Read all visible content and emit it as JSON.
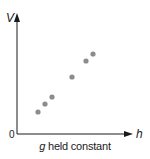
{
  "chart_data": {
    "type": "scatter",
    "title": "",
    "xlabel": "h",
    "ylabel": "V",
    "origin_label": "0",
    "caption_var": "g",
    "caption_rest": " held constant",
    "grid": false,
    "legend": null,
    "colors": {
      "axis": "#1a1a1a",
      "point": "#8c8c8c"
    },
    "points_px": [
      {
        "x": 38,
        "y": 112
      },
      {
        "x": 45,
        "y": 104
      },
      {
        "x": 52,
        "y": 97
      },
      {
        "x": 72,
        "y": 77
      },
      {
        "x": 86,
        "y": 61
      },
      {
        "x": 93,
        "y": 54
      }
    ],
    "note": "Qualitative scatter: V increases linearly with h; no numeric ticks shown"
  }
}
